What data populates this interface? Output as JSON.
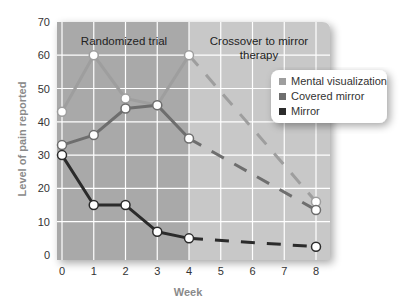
{
  "chart_data": {
    "type": "line",
    "title": "",
    "xlabel": "Week",
    "ylabel": "Level of pain reported",
    "x": [
      0,
      1,
      2,
      3,
      4,
      5,
      6,
      7,
      8
    ],
    "xticks": [
      "0",
      "1",
      "2",
      "3",
      "4",
      "5",
      "6",
      "7",
      "8"
    ],
    "yticks": [
      "0",
      "10",
      "20",
      "30",
      "40",
      "50",
      "60",
      "70"
    ],
    "ylim": [
      0,
      70
    ],
    "xlim": [
      0,
      8
    ],
    "grid": true,
    "legend_position": "right",
    "regions": [
      {
        "label": "Randomized trial",
        "from": 0,
        "to": 4
      },
      {
        "label": "Crossover to mirror therapy",
        "from": 4,
        "to": 8
      }
    ],
    "series": [
      {
        "name": "Mental visualization",
        "color": "#9e9e9e",
        "x": [
          0,
          1,
          2,
          3,
          4,
          8
        ],
        "values": [
          43,
          60,
          47,
          45,
          60,
          16
        ],
        "dashed_from_week": 4
      },
      {
        "name": "Covered mirror",
        "color": "#6e6e6e",
        "x": [
          0,
          1,
          2,
          3,
          4,
          8
        ],
        "values": [
          33,
          36,
          44,
          45,
          35,
          13.5
        ],
        "dashed_from_week": 4
      },
      {
        "name": "Mirror",
        "color": "#2b2b2b",
        "x": [
          0,
          1,
          2,
          3,
          4,
          8
        ],
        "values": [
          30,
          15,
          15,
          7,
          5,
          2.5
        ],
        "dashed_from_week": 4
      }
    ]
  },
  "labels": {
    "region1": "Randomized trial",
    "region2_line1": "Crossover to mirror",
    "region2_line2": "therapy",
    "xlabel": "Week",
    "ylabel": "Level of pain reported",
    "legend": [
      "Mental visualization",
      "Covered mirror",
      "Mirror"
    ]
  },
  "colors": {
    "region1_bg": "#a9a9a9",
    "region2_bg": "#c8c8c8",
    "grid": "#ffffff",
    "mental": "#9e9e9e",
    "covered": "#6e6e6e",
    "mirror": "#2b2b2b"
  }
}
